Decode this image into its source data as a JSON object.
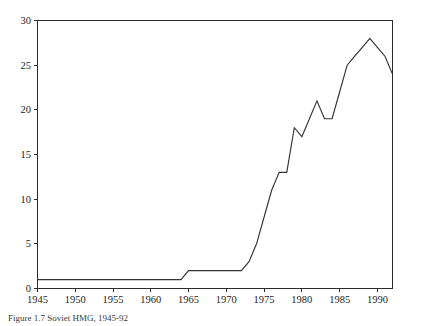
{
  "figure": {
    "caption": "Figure 1.7   Soviet HMG, 1945-92"
  },
  "chart_data": {
    "type": "line",
    "title": "",
    "subtitle": "",
    "xlabel": "",
    "ylabel": "",
    "xlim": [
      1945,
      1992
    ],
    "ylim": [
      0,
      30
    ],
    "grid": false,
    "legend": false,
    "legend_position": "none",
    "line_color": "#333333",
    "axis_color": "#2b2b2b",
    "xticks": [
      1945,
      1950,
      1955,
      1960,
      1965,
      1970,
      1975,
      1980,
      1985,
      1990
    ],
    "xtick_labels": [
      "1945",
      "1950",
      "1955",
      "1960",
      "1965",
      "1970",
      "1975",
      "1980",
      "1985",
      "1990"
    ],
    "yticks": [
      0,
      5,
      10,
      15,
      20,
      25,
      30
    ],
    "ytick_labels": [
      "0",
      "5",
      "10",
      "15",
      "20",
      "25",
      "30"
    ],
    "x": [
      1945,
      1946,
      1947,
      1948,
      1949,
      1950,
      1951,
      1952,
      1953,
      1954,
      1955,
      1956,
      1957,
      1958,
      1959,
      1960,
      1961,
      1962,
      1963,
      1964,
      1965,
      1966,
      1967,
      1968,
      1969,
      1970,
      1971,
      1972,
      1973,
      1974,
      1975,
      1976,
      1977,
      1978,
      1979,
      1980,
      1981,
      1982,
      1983,
      1984,
      1985,
      1986,
      1987,
      1988,
      1989,
      1990,
      1991,
      1992
    ],
    "values": [
      1,
      1,
      1,
      1,
      1,
      1,
      1,
      1,
      1,
      1,
      1,
      1,
      1,
      1,
      1,
      1,
      1,
      1,
      1,
      1,
      2,
      2,
      2,
      2,
      2,
      2,
      2,
      2,
      3,
      5,
      8,
      11,
      13,
      13,
      18,
      17,
      19,
      21,
      19,
      19,
      22,
      25,
      26,
      27,
      28,
      27,
      26,
      24
    ],
    "series": [
      {
        "name": "Soviet HMG",
        "values": [
          1,
          1,
          1,
          1,
          1,
          1,
          1,
          1,
          1,
          1,
          1,
          1,
          1,
          1,
          1,
          1,
          1,
          1,
          1,
          1,
          2,
          2,
          2,
          2,
          2,
          2,
          2,
          2,
          3,
          5,
          8,
          11,
          13,
          13,
          18,
          17,
          19,
          21,
          19,
          19,
          22,
          25,
          26,
          27,
          28,
          27,
          26,
          24
        ]
      }
    ]
  }
}
